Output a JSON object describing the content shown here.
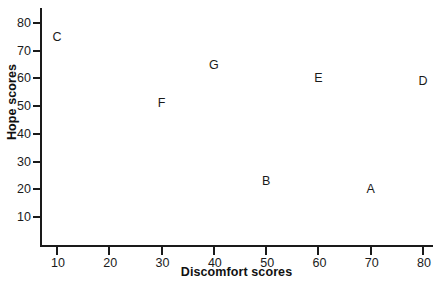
{
  "chart_data": {
    "type": "scatter",
    "title": "",
    "subtitle": "",
    "xlabel": "Discomfort scores",
    "ylabel": "Hope scores",
    "xlim": [
      0,
      85
    ],
    "ylim": [
      0,
      85
    ],
    "xticks": [
      10,
      20,
      30,
      40,
      50,
      60,
      70,
      80
    ],
    "yticks": [
      10,
      20,
      30,
      40,
      50,
      60,
      70,
      80
    ],
    "xtick_labels": [
      "10",
      "20",
      "30",
      "40",
      "50",
      "60",
      "70",
      "80"
    ],
    "ytick_labels": [
      "10",
      "20",
      "30",
      "40",
      "50",
      "60",
      "70",
      "80"
    ],
    "grid": false,
    "legend": false,
    "marker_style": "text-label",
    "point_color": "#1a1a1a",
    "axis_color": "#1a1a1a",
    "background": "#ffffff",
    "points": [
      {
        "label": "C",
        "x": 10,
        "y": 75
      },
      {
        "label": "F",
        "x": 30,
        "y": 51
      },
      {
        "label": "G",
        "x": 40,
        "y": 65
      },
      {
        "label": "B",
        "x": 50,
        "y": 23
      },
      {
        "label": "E",
        "x": 60,
        "y": 60
      },
      {
        "label": "A",
        "x": 70,
        "y": 20
      },
      {
        "label": "D",
        "x": 80,
        "y": 59
      }
    ],
    "annotations": []
  }
}
